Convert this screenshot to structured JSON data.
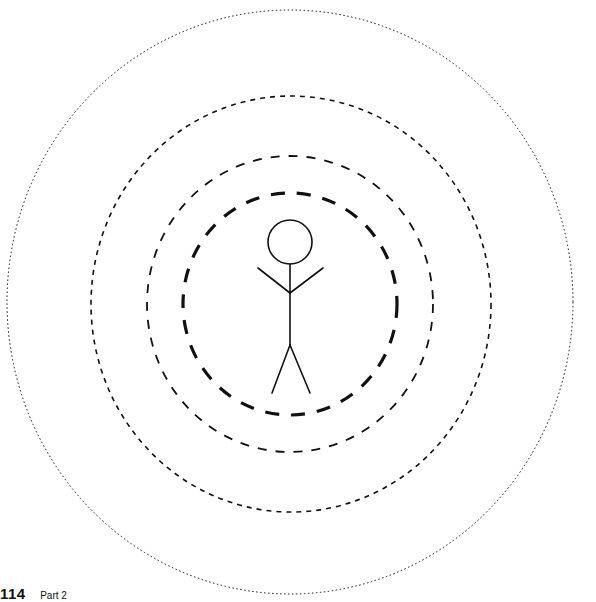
{
  "figure": {
    "colors": {
      "stroke": "#111111",
      "background": "#ffffff"
    },
    "rings": [
      {
        "name": "outer-dotted-ring",
        "cx": 290,
        "cy": 302,
        "rx": 283,
        "ry": 292,
        "stroke_width": 1,
        "dasharray": "1.5 2.5"
      },
      {
        "name": "third-fine-dashed-ring",
        "cx": 291,
        "cy": 304,
        "rx": 200,
        "ry": 208,
        "stroke_width": 1.6,
        "dasharray": "5 5"
      },
      {
        "name": "second-dashed-ring",
        "cx": 290,
        "cy": 304,
        "rx": 143,
        "ry": 148,
        "stroke_width": 1.8,
        "dasharray": "9 9"
      },
      {
        "name": "inner-thick-dashed-ring",
        "cx": 290,
        "cy": 304,
        "rx": 107,
        "ry": 111,
        "stroke_width": 3.2,
        "dasharray": "14 12"
      }
    ],
    "person": {
      "head": {
        "cx": 290,
        "cy": 242,
        "r": 22
      },
      "body": {
        "x1": 290,
        "y1": 264,
        "x2": 290,
        "y2": 345
      },
      "left_arm": {
        "x1": 258,
        "y1": 268,
        "x2": 290,
        "y2": 293
      },
      "right_arm": {
        "x1": 323,
        "y1": 268,
        "x2": 290,
        "y2": 293
      },
      "left_leg": {
        "x1": 290,
        "y1": 345,
        "x2": 272,
        "y2": 393
      },
      "right_leg": {
        "x1": 290,
        "y1": 345,
        "x2": 310,
        "y2": 393
      }
    }
  },
  "footer": {
    "page_number": "114",
    "section": "Part 2"
  }
}
